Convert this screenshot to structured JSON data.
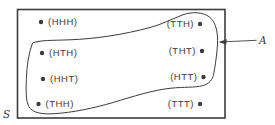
{
  "figure": {
    "type": "sample-space-venn-diagram",
    "sample_space_label": "S",
    "event_pointer_label": "A",
    "outcomes_left": [
      {
        "label": "(HHH)"
      },
      {
        "label": "(HTH)"
      },
      {
        "label": "(HHT)"
      },
      {
        "label": "(THH)"
      }
    ],
    "outcomes_right": [
      {
        "label": "(TTH)"
      },
      {
        "label": "(THT)"
      },
      {
        "label": "(HTT)"
      },
      {
        "label": "(TTT)"
      }
    ],
    "event_A_members": [
      "HTH",
      "HHT",
      "THH",
      "TTH",
      "THT",
      "HTT"
    ],
    "outside_event_A": [
      "HHH",
      "TTT"
    ],
    "colors": {
      "line": "#3c3c3c",
      "text": "#3d3d3d",
      "background": "#ffffff"
    }
  }
}
